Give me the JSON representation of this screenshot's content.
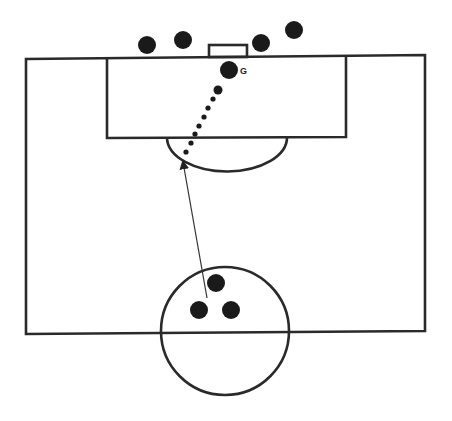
{
  "diagram": {
    "title": "",
    "field": {
      "outer": {
        "x1": 26,
        "y1": 58,
        "x2": 425,
        "y2": 334
      },
      "penalty_box": {
        "x1": 107,
        "y1": 57,
        "x2": 346,
        "y2": 138
      },
      "penalty_arc": {
        "cx": 227,
        "cy": 138,
        "rx": 60,
        "ry": 34
      },
      "goal": {
        "x": 209,
        "y": 45,
        "w": 38,
        "h": 12
      },
      "center_circle": {
        "cx": 225,
        "cy": 331,
        "r": 64
      }
    },
    "players_outside": [
      {
        "x": 147,
        "y": 45
      },
      {
        "x": 183,
        "y": 40
      },
      {
        "x": 261,
        "y": 43
      },
      {
        "x": 294,
        "y": 30
      }
    ],
    "goalkeeper": {
      "x": 229,
      "y": 70,
      "label": "G"
    },
    "center_players": [
      {
        "x": 216,
        "y": 283
      },
      {
        "x": 199,
        "y": 310
      },
      {
        "x": 231,
        "y": 310
      }
    ],
    "ball_path_dots": [
      {
        "x": 218,
        "y": 90,
        "r": 4.5
      },
      {
        "x": 213,
        "y": 99,
        "r": 2.6
      },
      {
        "x": 208,
        "y": 108,
        "r": 2.6
      },
      {
        "x": 204,
        "y": 117,
        "r": 2.6
      },
      {
        "x": 199,
        "y": 126,
        "r": 2.6
      },
      {
        "x": 195,
        "y": 134,
        "r": 2.6
      },
      {
        "x": 191,
        "y": 143,
        "r": 2.6
      },
      {
        "x": 186,
        "y": 152,
        "r": 2.6
      }
    ],
    "run_arrow": {
      "x1": 207,
      "y1": 298,
      "x2": 182,
      "y2": 158
    }
  }
}
